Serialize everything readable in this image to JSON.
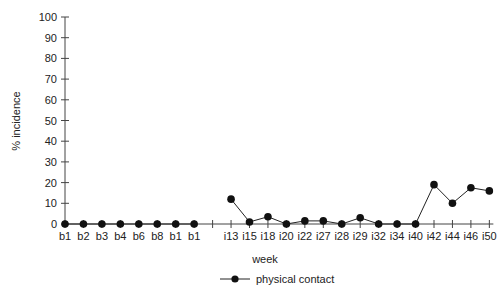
{
  "chart_data": {
    "type": "line",
    "title": "",
    "xlabel": "week",
    "ylabel": "% incidence",
    "ylim": [
      0,
      100
    ],
    "yticks": [
      0,
      10,
      20,
      30,
      40,
      50,
      60,
      70,
      80,
      90,
      100
    ],
    "grid": false,
    "legend_position": "bottom",
    "categories": [
      "b1",
      "b2",
      "b3",
      "b4",
      "b6",
      "b8",
      "b1",
      "b1",
      "",
      "i13",
      "i15",
      "i18",
      "i20",
      "i22",
      "i27",
      "i28",
      "i29",
      "i32",
      "i34",
      "i40",
      "i42",
      "i44",
      "i46",
      "i50"
    ],
    "series": [
      {
        "name": "physical contact",
        "segments": [
          {
            "categories": [
              "b1",
              "b2",
              "b3",
              "b4",
              "b6",
              "b8",
              "b1",
              "b1"
            ],
            "values": [
              0,
              0,
              0,
              0,
              0,
              0,
              0,
              0
            ]
          },
          {
            "categories": [
              "i13",
              "i15",
              "i18",
              "i20",
              "i22",
              "i27",
              "i28",
              "i29",
              "i32",
              "i34",
              "i40",
              "i42",
              "i44",
              "i46",
              "i50"
            ],
            "values": [
              12,
              1,
              3.5,
              0,
              1.5,
              1.5,
              0,
              3,
              0,
              0,
              0,
              19,
              10,
              17.5,
              16
            ]
          }
        ],
        "color": "#222222",
        "marker": "circle"
      }
    ]
  },
  "legend": {
    "items": [
      {
        "label": "physical contact"
      }
    ]
  }
}
